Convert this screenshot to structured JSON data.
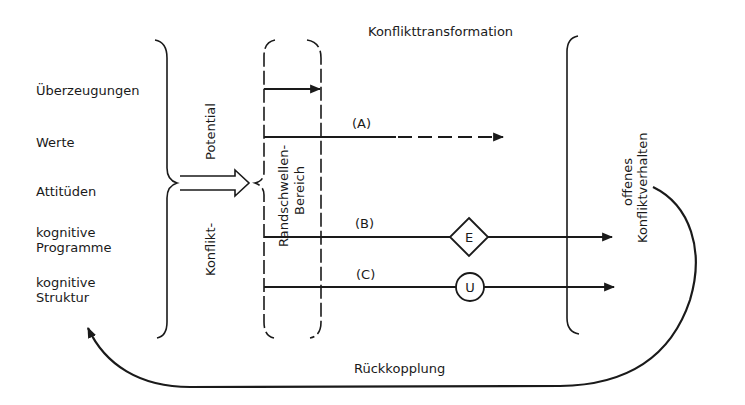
{
  "diagram": {
    "title": "Konflikttransformation",
    "sources": [
      {
        "label": "Überzeugungen"
      },
      {
        "label": "Werte"
      },
      {
        "label": "Attitüden"
      },
      {
        "label_line1": "kognitive",
        "label_line2": "Programme"
      },
      {
        "label_line1": "kognitive",
        "label_line2": "Struktur"
      }
    ],
    "potential_label_top": "Potential",
    "potential_label_bottom": "Konflikt-",
    "threshold_label_line1": "Randschwellen-",
    "threshold_label_line2": "Bereich",
    "paths": [
      {
        "id": "top",
        "label": "",
        "style": "solid",
        "ends_at": "threshold"
      },
      {
        "id": "A",
        "label": "(A)",
        "style": "solid-then-dashed",
        "ends_at": "before-behavior"
      },
      {
        "id": "B",
        "label": "(B)",
        "style": "solid",
        "node_shape": "diamond",
        "node_label": "E",
        "ends_at": "past-behavior"
      },
      {
        "id": "C",
        "label": "(C)",
        "style": "solid",
        "node_shape": "circle",
        "node_label": "U",
        "ends_at": "past-behavior"
      }
    ],
    "outcome_line1": "offenes",
    "outcome_line2": "Konfliktverhalten",
    "feedback_label": "Rückkopplung",
    "colors": {
      "ink": "#1a1a1a",
      "background": "#ffffff"
    }
  }
}
